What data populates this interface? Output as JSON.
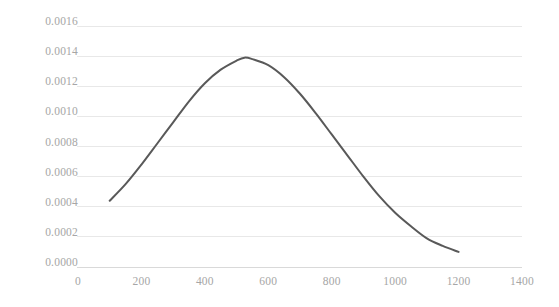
{
  "chart_data": {
    "type": "line",
    "title": "",
    "subtitle": "",
    "xlabel": "",
    "ylabel": "",
    "xlim": [
      0,
      1400
    ],
    "ylim": [
      0.0,
      0.0016
    ],
    "grid": "horizontal",
    "legend": "none",
    "x_ticks": [
      0,
      200,
      400,
      600,
      800,
      1000,
      1200,
      1400
    ],
    "x_tick_labels": [
      "0",
      "200",
      "400",
      "600",
      "800",
      "1000",
      "1200",
      "1400"
    ],
    "y_ticks": [
      0.0,
      0.0002,
      0.0004,
      0.0006,
      0.0008,
      0.001,
      0.0012,
      0.0014,
      0.0016
    ],
    "y_tick_labels": [
      "0.0000",
      "0.0002",
      "0.0004",
      "0.0006",
      "0.0008",
      "0.0010",
      "0.0012",
      "0.0014",
      "0.0016"
    ],
    "series": [
      {
        "name": "density",
        "color": "#595959",
        "line_width": 2,
        "x": [
          100,
          150,
          200,
          250,
          300,
          350,
          400,
          450,
          500,
          525,
          550,
          600,
          650,
          700,
          750,
          800,
          850,
          900,
          950,
          1000,
          1050,
          1100,
          1150,
          1200
        ],
        "values": [
          0.00044,
          0.00055,
          0.00068,
          0.00082,
          0.00096,
          0.0011,
          0.00122,
          0.00131,
          0.00137,
          0.00139,
          0.00138,
          0.00134,
          0.00126,
          0.00115,
          0.00102,
          0.00088,
          0.00074,
          0.0006,
          0.00047,
          0.00036,
          0.00027,
          0.00019,
          0.00014,
          0.0001
        ]
      }
    ],
    "annotations": []
  },
  "colors": {
    "line": "#595959",
    "gridline": "#e8e8e8",
    "axis": "#d9d9d9",
    "tick_text": "#a6a6a6",
    "background": "#ffffff"
  },
  "geometry": {
    "plot_left_px": 78,
    "plot_right_px": 522,
    "y_zero_px": 267,
    "y_top_px": 26
  }
}
